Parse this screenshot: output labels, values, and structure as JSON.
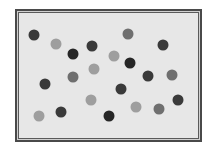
{
  "frame": {
    "x": 15,
    "y": 9,
    "width": 187,
    "height": 133,
    "border_color": "#4a4a4a",
    "fill_color": "#e7e7e7"
  },
  "dot_colors": {
    "darkest": "#262626",
    "dark": "#3a3a3a",
    "medium": "#6f6f6f",
    "light": "#9e9e9e"
  },
  "dots": [
    {
      "x": 34,
      "y": 35,
      "shade": "dark"
    },
    {
      "x": 56,
      "y": 44,
      "shade": "light"
    },
    {
      "x": 73,
      "y": 54,
      "shade": "darkest"
    },
    {
      "x": 92,
      "y": 46,
      "shade": "dark"
    },
    {
      "x": 128,
      "y": 34,
      "shade": "medium"
    },
    {
      "x": 163,
      "y": 45,
      "shade": "dark"
    },
    {
      "x": 114,
      "y": 56,
      "shade": "light"
    },
    {
      "x": 130,
      "y": 63,
      "shade": "darkest"
    },
    {
      "x": 94,
      "y": 69,
      "shade": "light"
    },
    {
      "x": 73,
      "y": 77,
      "shade": "medium"
    },
    {
      "x": 45,
      "y": 84,
      "shade": "dark"
    },
    {
      "x": 148,
      "y": 76,
      "shade": "dark"
    },
    {
      "x": 172,
      "y": 75,
      "shade": "medium"
    },
    {
      "x": 121,
      "y": 89,
      "shade": "dark"
    },
    {
      "x": 91,
      "y": 100,
      "shade": "light"
    },
    {
      "x": 178,
      "y": 100,
      "shade": "dark"
    },
    {
      "x": 39,
      "y": 116,
      "shade": "light"
    },
    {
      "x": 61,
      "y": 112,
      "shade": "dark"
    },
    {
      "x": 109,
      "y": 116,
      "shade": "darkest"
    },
    {
      "x": 136,
      "y": 107,
      "shade": "light"
    },
    {
      "x": 159,
      "y": 109,
      "shade": "medium"
    }
  ]
}
